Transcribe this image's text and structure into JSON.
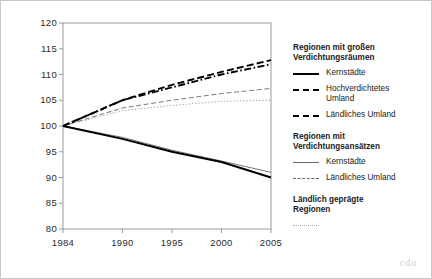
{
  "figure": {
    "background_color": "#ffffff",
    "border_color": "#c8c8c8",
    "watermark": "cdu"
  },
  "axes": {
    "y_ticks": [
      "120",
      "115",
      "110",
      "105",
      "100",
      "95",
      "90",
      "85",
      "80"
    ],
    "x_ticks": [
      "1984",
      "1990",
      "1995",
      "2000",
      "2005"
    ],
    "frame_color": "#999999"
  },
  "legend": {
    "groups": [
      {
        "heading": "Regionen mit großen\nVerdichtungsräumen",
        "entries": [
          {
            "label": "Kernstädte",
            "style": "solid-thick",
            "sample": "solid-thick-sample"
          },
          {
            "label": "Hochverdichtetes\nUmland",
            "style": "dash-dot-thick",
            "sample": "dash-dot-thick-sample"
          },
          {
            "label": "Ländliches Umland",
            "style": "dashed-thick",
            "sample": "dashed-thick-sample"
          }
        ]
      },
      {
        "heading": "Regionen mit\nVerdichtungsansätzen",
        "entries": [
          {
            "label": "Kernstädte",
            "style": "solid-thin",
            "sample": "solid-thin-sample"
          },
          {
            "label": "Ländliches Umland",
            "style": "dashed-thin",
            "sample": "dashed-thin-sample"
          }
        ]
      },
      {
        "heading": "Ländlich geprägte\nRegionen",
        "entries": [
          {
            "label": "",
            "style": "dotted-thin",
            "sample": "dotted-thin-sample"
          }
        ]
      }
    ]
  },
  "chart_data": {
    "type": "line",
    "title": "",
    "xlabel": "",
    "ylabel": "",
    "x": [
      1984,
      1990,
      1995,
      2000,
      2005
    ],
    "xlim": [
      1984,
      2005
    ],
    "ylim": [
      80,
      120
    ],
    "y_tick_values": [
      80,
      85,
      90,
      95,
      100,
      105,
      110,
      115,
      120
    ],
    "grid": false,
    "legend_position": "right",
    "index_base_year": 1984,
    "index_base_value": 100,
    "series": [
      {
        "name": "Regionen mit großen Verdichtungsräumen — Kernstädte",
        "group": "Regionen mit großen Verdichtungsräumen",
        "short_name": "Kernstädte",
        "style": "solid-thick",
        "color": "#000000",
        "values": [
          100,
          97.5,
          95,
          93,
          90
        ]
      },
      {
        "name": "Regionen mit großen Verdichtungsräumen — Hochverdichtetes Umland",
        "group": "Regionen mit großen Verdichtungsräumen",
        "short_name": "Hochverdichtetes Umland",
        "style": "dash-dot-thick",
        "color": "#000000",
        "values": [
          100,
          105,
          107.5,
          110,
          112
        ]
      },
      {
        "name": "Regionen mit großen Verdichtungsräumen — Ländliches Umland",
        "group": "Regionen mit großen Verdichtungsräumen",
        "short_name": "Ländliches Umland",
        "style": "dashed-thick",
        "color": "#000000",
        "values": [
          100,
          105,
          108,
          110.5,
          112.8
        ]
      },
      {
        "name": "Regionen mit Verdichtungsansätzen — Kernstädte",
        "group": "Regionen mit Verdichtungsansätzen",
        "short_name": "Kernstädte",
        "style": "solid-thin",
        "color": "#555555",
        "values": [
          100,
          97.8,
          95.3,
          93.2,
          91
        ]
      },
      {
        "name": "Regionen mit Verdichtungsansätzen — Ländliches Umland",
        "group": "Regionen mit Verdichtungsansätzen",
        "short_name": "Ländliches Umland",
        "style": "dashed-thin",
        "color": "#555555",
        "values": [
          100,
          103.5,
          105,
          106.3,
          107.3
        ]
      },
      {
        "name": "Ländlich geprägte Regionen",
        "group": "Ländlich geprägte Regionen",
        "short_name": "Ländlich geprägte Regionen",
        "style": "dotted-thin",
        "color": "#8a8a8a",
        "values": [
          100,
          103,
          104,
          104.8,
          105
        ]
      }
    ]
  }
}
